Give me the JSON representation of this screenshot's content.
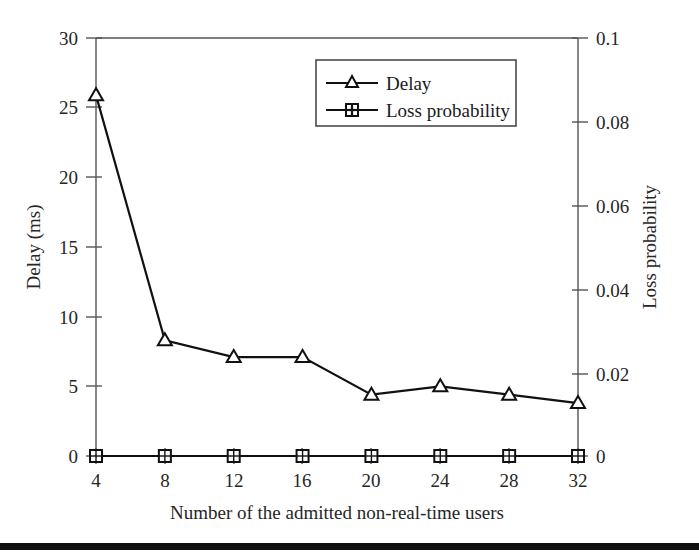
{
  "chart_data": {
    "type": "line",
    "title": "",
    "xlabel": "Number of the admitted non-real-time users",
    "ylabel": "Delay (ms)",
    "y2label": "Loss probability",
    "x": [
      4,
      8,
      12,
      16,
      20,
      24,
      28,
      32
    ],
    "xtick_labels": [
      "4",
      "8",
      "12",
      "16",
      "20",
      "24",
      "28",
      "32"
    ],
    "xlim": [
      4,
      32
    ],
    "ylim": [
      0,
      30
    ],
    "ytick_labels": [
      "0",
      "5",
      "10",
      "15",
      "20",
      "25",
      "30"
    ],
    "yticks": [
      0,
      5,
      10,
      15,
      20,
      25,
      30
    ],
    "y2lim": [
      0,
      0.1
    ],
    "y2tick_labels": [
      "0",
      "0.02",
      "0.04",
      "0.06",
      "0.08",
      "0.1"
    ],
    "y2ticks": [
      0,
      0.02,
      0.04,
      0.06,
      0.08,
      0.1
    ],
    "grid": false,
    "legend_position": "top-center-right",
    "series": [
      {
        "name": "Delay",
        "axis": "left",
        "marker": "triangle",
        "color": "#111111",
        "values": [
          25.9,
          8.3,
          7.1,
          7.1,
          4.4,
          5.0,
          4.4,
          3.8
        ]
      },
      {
        "name": "Loss probability",
        "axis": "right",
        "marker": "square",
        "color": "#111111",
        "values": [
          0,
          0,
          0,
          0,
          0,
          0,
          0,
          0
        ]
      }
    ]
  },
  "legend": {
    "entries": [
      {
        "label": "Delay",
        "marker": "triangle-marker"
      },
      {
        "label": "Loss probability",
        "marker": "square-marker"
      }
    ]
  },
  "axes": {
    "left_title": "Delay (ms)",
    "right_title": "Loss probability",
    "bottom_title": "Number of the admitted non-real-time users"
  },
  "colors": {
    "ink": "#111111",
    "axis": "#555555",
    "background": "#ffffff",
    "band": "#111111"
  }
}
